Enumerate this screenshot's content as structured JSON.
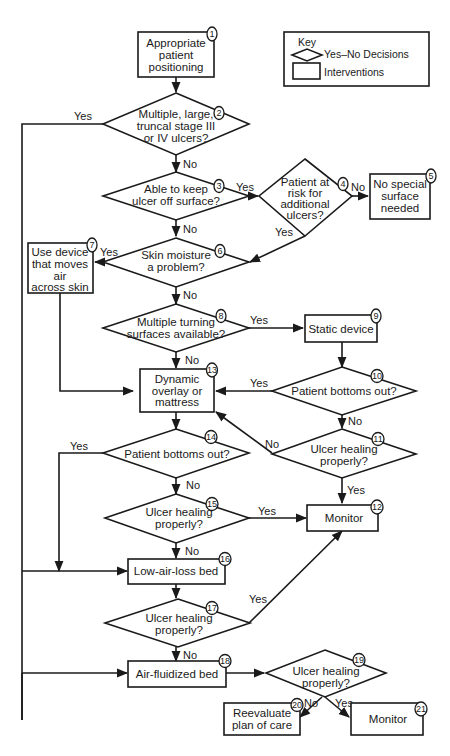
{
  "key": {
    "title": "Key",
    "decision_label": "Yes–No Decisions",
    "intervention_label": "Interventions"
  },
  "nodes": {
    "n1": {
      "num": "1",
      "type": "intervention",
      "lines": [
        "Appropriate",
        "patient",
        "positioning"
      ]
    },
    "n2": {
      "num": "2",
      "type": "decision",
      "lines": [
        "Multiple, large,",
        "truncal stage III",
        "or IV ulcers?"
      ]
    },
    "n3": {
      "num": "3",
      "type": "decision",
      "lines": [
        "Able to keep",
        "ulcer off surface?"
      ]
    },
    "n4": {
      "num": "4",
      "type": "decision",
      "lines": [
        "Patient at",
        "risk for",
        "additional",
        "ulcers?"
      ]
    },
    "n5": {
      "num": "5",
      "type": "intervention",
      "lines": [
        "No special",
        "surface",
        "needed"
      ]
    },
    "n6": {
      "num": "6",
      "type": "decision",
      "lines": [
        "Skin moisture",
        "a problem?"
      ]
    },
    "n7": {
      "num": "7",
      "type": "intervention",
      "lines": [
        "Use device",
        "that moves",
        "air",
        "across skin"
      ]
    },
    "n8": {
      "num": "8",
      "type": "decision",
      "lines": [
        "Multiple turning",
        "surfaces available?"
      ]
    },
    "n9": {
      "num": "9",
      "type": "intervention",
      "lines": [
        "Static device"
      ]
    },
    "n10": {
      "num": "10",
      "type": "decision",
      "lines": [
        "Patient bottoms out?"
      ]
    },
    "n11": {
      "num": "11",
      "type": "decision",
      "lines": [
        "Ulcer healing",
        "properly?"
      ]
    },
    "n12": {
      "num": "12",
      "type": "intervention",
      "lines": [
        "Monitor"
      ]
    },
    "n13": {
      "num": "13",
      "type": "intervention",
      "lines": [
        "Dynamic",
        "overlay or",
        "mattress"
      ]
    },
    "n14": {
      "num": "14",
      "type": "decision",
      "lines": [
        "Patient bottoms out?"
      ]
    },
    "n15": {
      "num": "15",
      "type": "decision",
      "lines": [
        "Ulcer healing",
        "properly?"
      ]
    },
    "n16": {
      "num": "16",
      "type": "intervention",
      "lines": [
        "Low-air-loss bed"
      ]
    },
    "n17": {
      "num": "17",
      "type": "decision",
      "lines": [
        "Ulcer healing",
        "properly?"
      ]
    },
    "n18": {
      "num": "18",
      "type": "intervention",
      "lines": [
        "Air-fluidized bed"
      ]
    },
    "n19": {
      "num": "19",
      "type": "decision",
      "lines": [
        "Ulcer healing",
        "properly?"
      ]
    },
    "n20": {
      "num": "20",
      "type": "intervention",
      "lines": [
        "Reevaluate",
        "plan of care"
      ]
    },
    "n21": {
      "num": "21",
      "type": "intervention",
      "lines": [
        "Monitor"
      ]
    }
  },
  "edges": {
    "e2_yes": "Yes",
    "e2_no": "No",
    "e3_yes": "Yes",
    "e3_no": "No",
    "e4_no": "No",
    "e4_yes": "Yes",
    "e6_yes": "Yes",
    "e6_no": "No",
    "e8_yes": "Yes",
    "e8_no": "No",
    "e10_yes": "Yes",
    "e10_no": "No",
    "e11_no": "No",
    "e11_yes": "Yes",
    "e14_yes": "Yes",
    "e14_no": "No",
    "e15_yes": "Yes",
    "e15_no": "No",
    "e17_yes": "Yes",
    "e17_no": "No",
    "e19_no": "No",
    "e19_yes": "Yes"
  }
}
